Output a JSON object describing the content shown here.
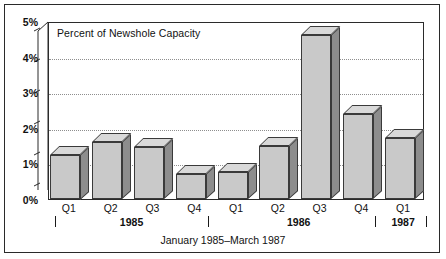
{
  "figure": {
    "caption": "January 1985–March 1987",
    "plot_title": "Percent of Newshole Capacity"
  },
  "chart_data": {
    "type": "bar",
    "title": "Percent of Newshole Capacity",
    "xlabel": "January 1985–March 1987",
    "ylabel": "",
    "ylim": [
      0,
      5
    ],
    "ytick_labels": [
      "0%",
      "1%",
      "2%",
      "3%",
      "4%",
      "5%"
    ],
    "ytick_values": [
      0,
      1,
      2,
      3,
      4,
      5
    ],
    "gridlines_at": [
      1,
      2,
      3,
      4
    ],
    "grid": true,
    "legend": "none",
    "style": "3d-bars",
    "categories": [
      "Q1",
      "Q2",
      "Q3",
      "Q4",
      "Q1",
      "Q2",
      "Q3",
      "Q4",
      "Q1"
    ],
    "values": [
      1.25,
      1.6,
      1.45,
      0.7,
      0.75,
      1.5,
      4.6,
      2.4,
      1.7
    ],
    "groups": [
      {
        "label": "1985",
        "quarters": [
          "Q1",
          "Q2",
          "Q3",
          "Q4"
        ]
      },
      {
        "label": "1986",
        "quarters": [
          "Q1",
          "Q2",
          "Q3",
          "Q4"
        ]
      },
      {
        "label": "1987",
        "quarters": [
          "Q1"
        ]
      }
    ],
    "colors": {
      "bar_face": "#c9c9c9",
      "bar_side": "#8d8d8d",
      "bar_top": "#d9d9d9",
      "outline": "#3a3a3a",
      "grid": "#8e8e8e",
      "axis": "#2b2b2b"
    }
  }
}
